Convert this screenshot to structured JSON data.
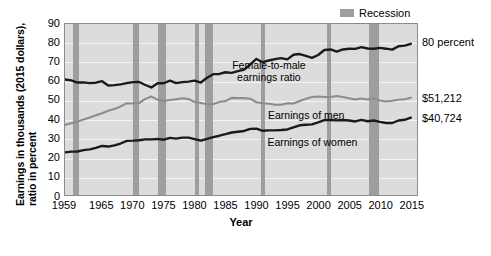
{
  "chart_data": {
    "type": "line",
    "title": "",
    "xlabel": "Year",
    "ylabel_line1": "Earnings in thousands (2015 dollars),",
    "ylabel_line2": "ratio in percent",
    "xlim": [
      1959,
      2016
    ],
    "ylim": [
      0,
      90
    ],
    "ytick_labels": [
      "0",
      "10",
      "20",
      "30",
      "40",
      "50",
      "60",
      "70",
      "80",
      "90"
    ],
    "ytick_values": [
      0,
      10,
      20,
      30,
      40,
      50,
      60,
      70,
      80,
      90
    ],
    "xtick_labels": [
      "1959",
      "1965",
      "1970",
      "1975",
      "1980",
      "1985",
      "1990",
      "1995",
      "2000",
      "2005",
      "2010",
      "2015"
    ],
    "xtick_values": [
      1959,
      1965,
      1970,
      1975,
      1980,
      1985,
      1990,
      1995,
      2000,
      2005,
      2010,
      2015
    ],
    "grid": true,
    "legend_position": "top-right",
    "legend": [
      {
        "label": "Recession",
        "color": "#9e9e9e",
        "kind": "band"
      }
    ],
    "colors": {
      "ratio": "#1a1a1a",
      "men": "#8c8c8c",
      "women": "#1a1a1a",
      "recession_band": "#9e9e9e",
      "plot_background": "#dcdcdc",
      "gridline": "#f4f4f4",
      "axis": "#8c8c8c"
    },
    "annotations": [
      {
        "text": "Female-to-male",
        "x": 1992,
        "y": 68
      },
      {
        "text": "earnings ratio",
        "x": 1992,
        "y": 62
      },
      {
        "text": "Earnings of men",
        "x": 1998,
        "y": 42
      },
      {
        "text": "Earnings of women",
        "x": 1999,
        "y": 28
      }
    ],
    "end_labels": [
      {
        "text": "80 percent",
        "series": "Female-to-male earnings ratio",
        "value": 80
      },
      {
        "text": "$51,212",
        "series": "Earnings of men",
        "value": 51.212
      },
      {
        "text": "$40,724",
        "series": "Earnings of women",
        "value": 40.724
      }
    ],
    "recessions": [
      {
        "start": 1960.3,
        "end": 1961.2
      },
      {
        "start": 1969.9,
        "end": 1970.9
      },
      {
        "start": 1973.9,
        "end": 1975.2
      },
      {
        "start": 1980.0,
        "end": 1980.6
      },
      {
        "start": 1981.5,
        "end": 1982.9
      },
      {
        "start": 1990.5,
        "end": 1991.2
      },
      {
        "start": 2001.2,
        "end": 2001.9
      },
      {
        "start": 2007.9,
        "end": 2009.5
      }
    ],
    "series": [
      {
        "name": "Female-to-male earnings ratio",
        "unit": "percent",
        "color": "#1a1a1a",
        "x": [
          1959,
          1960,
          1961,
          1962,
          1963,
          1964,
          1965,
          1966,
          1967,
          1968,
          1969,
          1970,
          1971,
          1972,
          1973,
          1974,
          1975,
          1976,
          1977,
          1978,
          1979,
          1980,
          1981,
          1982,
          1983,
          1984,
          1985,
          1986,
          1987,
          1988,
          1989,
          1990,
          1991,
          1992,
          1993,
          1994,
          1995,
          1996,
          1997,
          1998,
          1999,
          2000,
          2001,
          2002,
          2003,
          2004,
          2005,
          2006,
          2007,
          2008,
          2009,
          2010,
          2011,
          2012,
          2013,
          2014,
          2015
        ],
        "y": [
          60.8,
          60.3,
          59.2,
          59.3,
          58.9,
          59.1,
          59.9,
          57.6,
          57.8,
          58.2,
          58.9,
          59.4,
          59.5,
          57.9,
          56.6,
          58.8,
          58.8,
          60.2,
          58.9,
          59.4,
          59.7,
          60.2,
          59.2,
          61.7,
          63.6,
          63.7,
          64.6,
          64.3,
          65.2,
          66.0,
          68.7,
          71.6,
          69.9,
          70.8,
          71.5,
          72.0,
          71.4,
          73.8,
          74.2,
          73.2,
          72.2,
          73.7,
          76.3,
          76.6,
          75.5,
          76.6,
          77.0,
          76.9,
          77.8,
          77.1,
          77.0,
          77.4,
          77.0,
          76.5,
          78.3,
          78.6,
          79.6
        ]
      },
      {
        "name": "Earnings of men",
        "unit": "thousands of 2015 dollars",
        "color": "#8c8c8c",
        "x": [
          1959,
          1960,
          1961,
          1962,
          1963,
          1964,
          1965,
          1966,
          1967,
          1968,
          1969,
          1970,
          1971,
          1972,
          1973,
          1974,
          1975,
          1976,
          1977,
          1978,
          1979,
          1980,
          1981,
          1982,
          1983,
          1984,
          1985,
          1986,
          1987,
          1988,
          1989,
          1990,
          1991,
          1992,
          1993,
          1994,
          1995,
          1996,
          1997,
          1998,
          1999,
          2000,
          2001,
          2002,
          2003,
          2004,
          2005,
          2006,
          2007,
          2008,
          2009,
          2010,
          2011,
          2012,
          2013,
          2014,
          2015
        ],
        "y": [
          36.9,
          37.8,
          38.6,
          39.8,
          40.8,
          42.0,
          43.0,
          44.3,
          45.2,
          46.6,
          48.3,
          48.2,
          48.4,
          50.6,
          51.8,
          50.2,
          49.5,
          50.0,
          50.4,
          50.9,
          50.5,
          48.9,
          48.4,
          47.8,
          47.9,
          48.9,
          49.5,
          51.1,
          51.0,
          51.0,
          50.7,
          48.8,
          48.3,
          48.0,
          47.5,
          47.5,
          48.3,
          48.2,
          49.5,
          50.6,
          51.6,
          51.8,
          51.6,
          51.6,
          52.1,
          51.6,
          50.9,
          50.3,
          50.8,
          50.3,
          50.9,
          49.7,
          49.2,
          49.6,
          50.1,
          50.4,
          51.2
        ]
      },
      {
        "name": "Earnings of women",
        "unit": "thousands of 2015 dollars",
        "color": "#1a1a1a",
        "x": [
          1959,
          1960,
          1961,
          1962,
          1963,
          1964,
          1965,
          1966,
          1967,
          1968,
          1969,
          1970,
          1971,
          1972,
          1973,
          1974,
          1975,
          1976,
          1977,
          1978,
          1979,
          1980,
          1981,
          1982,
          1983,
          1984,
          1985,
          1986,
          1987,
          1988,
          1989,
          1990,
          1991,
          1992,
          1993,
          1994,
          1995,
          1996,
          1997,
          1998,
          1999,
          2000,
          2001,
          2002,
          2003,
          2004,
          2005,
          2006,
          2007,
          2008,
          2009,
          2010,
          2011,
          2012,
          2013,
          2014,
          2015
        ],
        "y": [
          22.4,
          22.8,
          22.9,
          23.6,
          24.0,
          24.8,
          25.8,
          25.5,
          26.1,
          27.1,
          28.5,
          28.6,
          28.8,
          29.3,
          29.3,
          29.5,
          29.1,
          30.1,
          29.7,
          30.2,
          30.2,
          29.4,
          28.6,
          29.5,
          30.5,
          31.2,
          32.0,
          32.9,
          33.3,
          33.7,
          34.8,
          34.9,
          33.8,
          34.0,
          34.0,
          34.2,
          34.5,
          35.6,
          36.7,
          37.0,
          37.2,
          38.2,
          39.4,
          39.5,
          39.3,
          39.5,
          39.2,
          38.7,
          39.5,
          38.8,
          39.2,
          38.5,
          37.9,
          37.9,
          39.2,
          39.6,
          40.7
        ]
      }
    ]
  }
}
